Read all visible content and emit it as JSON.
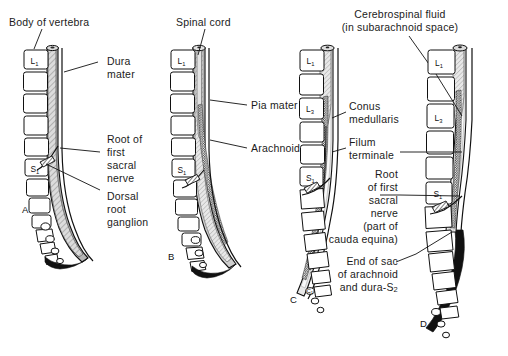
{
  "figure": {
    "panels": [
      {
        "id": "A",
        "letter": "A",
        "vertebra_labels": [
          "L1",
          "S1"
        ],
        "labels": [
          {
            "name": "body-of-vertebra",
            "text": "Body of vertebra"
          },
          {
            "name": "dura-mater",
            "text": "Dura\nmater"
          },
          {
            "name": "root-of-first-sacral-nerve",
            "text": "Root of\nfirst\nsacral\nnerve"
          },
          {
            "name": "dorsal-root-ganglion",
            "text": "Dorsal\nroot\nganglion"
          }
        ]
      },
      {
        "id": "B",
        "letter": "B",
        "vertebra_labels": [
          "L1",
          "S1"
        ],
        "labels": [
          {
            "name": "spinal-cord",
            "text": "Spinal cord"
          },
          {
            "name": "pia-mater",
            "text": "Pia mater"
          },
          {
            "name": "arachnoid",
            "text": "Arachnoid"
          }
        ]
      },
      {
        "id": "C",
        "letter": "C",
        "vertebra_labels": [
          "L1",
          "L3",
          "S1",
          "C1"
        ],
        "labels": [
          {
            "name": "cerebrospinal-fluid",
            "text": "Cerebrospinal fluid\n(in subarachnoid space)"
          },
          {
            "name": "conus-medullaris",
            "text": "Conus\nmedullaris"
          },
          {
            "name": "filum-terminale",
            "text": "Filum\nterminale"
          },
          {
            "name": "root-of-first-sacral-nerve-cauda-equina",
            "text": "Root\nof first\nsacral\nnerve\n(part of\ncauda equina)"
          },
          {
            "name": "end-of-sac-of-arachnoid-and-dura",
            "text": "End of sac\nof arachnoid\nand dura-S2"
          }
        ]
      },
      {
        "id": "D",
        "letter": "D",
        "vertebra_labels": [
          "L1",
          "L3",
          "S1"
        ],
        "labels": []
      }
    ],
    "label_texts": {
      "body_of_vertebra": "Body of vertebra",
      "dura_mater_line1": "Dura",
      "dura_mater_line2": "mater",
      "root_first_sacral_l1": "Root of",
      "root_first_sacral_l2": "first",
      "root_first_sacral_l3": "sacral",
      "root_first_sacral_l4": "nerve",
      "dorsal_root_ganglion_l1": "Dorsal",
      "dorsal_root_ganglion_l2": "root",
      "dorsal_root_ganglion_l3": "ganglion",
      "spinal_cord": "Spinal cord",
      "pia_mater": "Pia mater",
      "arachnoid": "Arachnoid",
      "csf_l1": "Cerebrospinal fluid",
      "csf_l2": "(in subarachnoid space)",
      "conus_l1": "Conus",
      "conus_l2": "medullaris",
      "filum_l1": "Filum",
      "filum_l2": "terminale",
      "cauda_l1": "Root",
      "cauda_l2": "of first",
      "cauda_l3": "sacral",
      "cauda_l4": "nerve",
      "cauda_l5": "(part of",
      "cauda_l6": "cauda equina)",
      "endsac_l1": "End of sac",
      "endsac_l2": "of arachnoid",
      "endsac_l3": "and dura-S",
      "endsac_sub": "2",
      "letter_a": "A",
      "letter_b": "B",
      "letter_c": "C",
      "letter_d": "D",
      "vert_L": "L",
      "vert_S": "S",
      "vert_C": "C",
      "sub_1": "1",
      "sub_3": "3"
    },
    "colors": {
      "ink": "#111111",
      "paper": "#ffffff",
      "dura_fill": "#b9b9b9",
      "cord_fill": "#e2e2e2",
      "arachnoid_fill": "#8d8d8d",
      "csf_fill": "#f4f4f4",
      "sac_black": "#111111"
    }
  }
}
